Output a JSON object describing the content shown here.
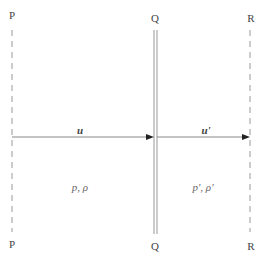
{
  "diagram": {
    "type": "shock-wave-schematic",
    "planes": [
      {
        "id": "P",
        "label_top": "P",
        "label_bottom": "P",
        "style": "dashed"
      },
      {
        "id": "Q",
        "label_top": "Q",
        "label_bottom": "Q",
        "style": "double-solid"
      },
      {
        "id": "R",
        "label_top": "R",
        "label_bottom": "R",
        "style": "dashed"
      }
    ],
    "arrows": [
      {
        "from": "P",
        "to": "Q",
        "label": "u"
      },
      {
        "from": "Q",
        "to": "R",
        "label": "u'"
      }
    ],
    "regions": [
      {
        "between": "P-Q",
        "label": "p, ρ"
      },
      {
        "between": "Q-R",
        "label": "p', ρ'"
      }
    ],
    "colors": {
      "line": "#999999",
      "arrow": "#888888",
      "text": "#444444",
      "background": "#ffffff"
    }
  }
}
